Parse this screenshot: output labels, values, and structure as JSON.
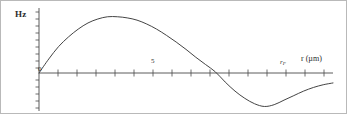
{
  "figure": {
    "background_color": "#ffffff",
    "border_color": "#b9b9b9",
    "ink_color": "#3a3a3a"
  },
  "axes": {
    "y_axis_label": "Hz",
    "x_axis_label": "r (µm)",
    "origin_label": "0",
    "mid_tick_label": "5",
    "rf_tick_symbol": "r",
    "rf_tick_subscript": "F"
  },
  "chart_data": {
    "type": "line",
    "title": "",
    "subtitle": "",
    "xlabel": "r (µm)",
    "ylabel": "Hz",
    "grid": false,
    "legend": null,
    "annotations": [
      {
        "text": "0",
        "x": 0,
        "y": 0,
        "role": "origin-tick-label"
      },
      {
        "text": "5",
        "x": 5,
        "y": 0,
        "role": "x-tick-label"
      },
      {
        "text": "r_F",
        "x": 12.5,
        "y": 0,
        "role": "x-tick-label"
      }
    ],
    "xlim": [
      0,
      15
    ],
    "ylim": [
      -0.42,
      1.12
    ],
    "x_tick_values": [
      0,
      1,
      2,
      3,
      4,
      5,
      6,
      7,
      8,
      9,
      10,
      11,
      12,
      13,
      14,
      15
    ],
    "x_labeled_ticks": [
      {
        "value": 0,
        "label": "0"
      },
      {
        "value": 5,
        "label": "5"
      },
      {
        "value": 12.5,
        "label": "r_F"
      }
    ],
    "y_tick_values": [],
    "y_tick_labels": [],
    "series": [
      {
        "name": "Hz(r)",
        "color": "#3a3a3a",
        "x": [
          0.0,
          0.5,
          1.0,
          1.5,
          2.0,
          2.5,
          3.0,
          3.5,
          4.0,
          4.5,
          5.0,
          5.5,
          6.0,
          6.5,
          7.0,
          7.5,
          8.0,
          8.5,
          9.0,
          9.5,
          10.0,
          10.5,
          11.0,
          11.5,
          12.0,
          12.5,
          13.0,
          13.5,
          14.0,
          14.5,
          15.0
        ],
        "y": [
          0.0,
          0.25,
          0.47,
          0.64,
          0.78,
          0.89,
          0.96,
          1.0,
          1.0,
          0.98,
          0.94,
          0.87,
          0.78,
          0.67,
          0.55,
          0.42,
          0.28,
          0.15,
          0.02,
          -0.1,
          -0.2,
          -0.28,
          -0.34,
          -0.37,
          -0.35,
          -0.3,
          -0.25,
          -0.2,
          -0.16,
          -0.13,
          -0.11
        ]
      }
    ]
  }
}
